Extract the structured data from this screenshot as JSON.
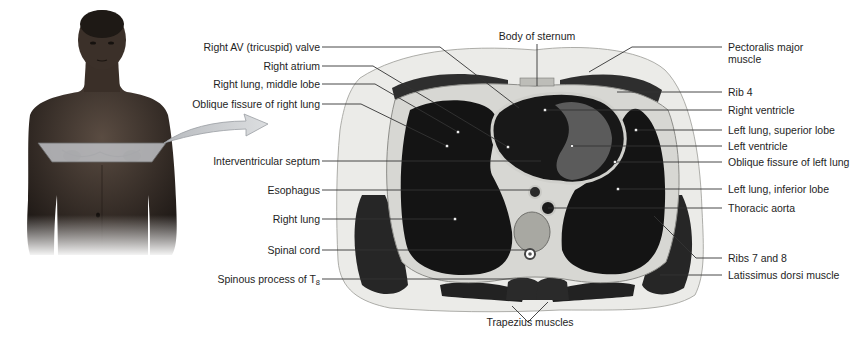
{
  "figure": {
    "body_photo": {
      "description": "Anterior view of male torso with transverse plane marked across chest",
      "plane_color": "#b9bcc0",
      "arrow_color": "#c9ccd0"
    },
    "labels_left": [
      {
        "id": "tricuspid",
        "text": "Right AV (tricuspid) valve"
      },
      {
        "id": "right-atrium",
        "text": "Right atrium"
      },
      {
        "id": "rlung-middle",
        "text": "Right lung, middle lobe"
      },
      {
        "id": "oblique-right",
        "text": "Oblique fissure of right lung"
      },
      {
        "id": "septum",
        "text": "Interventricular septum"
      },
      {
        "id": "esophagus",
        "text": "Esophagus"
      },
      {
        "id": "right-lung",
        "text": "Right lung"
      },
      {
        "id": "spinal-cord",
        "text": "Spinal cord"
      },
      {
        "id": "spinous",
        "text": "Spinous process of T",
        "sub": "8"
      }
    ],
    "labels_right": [
      {
        "id": "pectoralis",
        "text": "Pectoralis major",
        "text2": "muscle"
      },
      {
        "id": "rib4",
        "text": "Rib 4"
      },
      {
        "id": "right-ventricle",
        "text": "Right ventricle"
      },
      {
        "id": "llung-superior",
        "text": "Left lung, superior lobe"
      },
      {
        "id": "left-ventricle",
        "text": "Left ventricle"
      },
      {
        "id": "oblique-left",
        "text": "Oblique fissure of left lung"
      },
      {
        "id": "llung-inferior",
        "text": "Left lung, inferior lobe"
      },
      {
        "id": "aorta",
        "text": "Thoracic aorta"
      },
      {
        "id": "ribs78",
        "text": "Ribs 7 and 8"
      },
      {
        "id": "latissimus",
        "text": "Latissimus dorsi muscle"
      }
    ],
    "labels_center": {
      "sternum": "Body of sternum",
      "trapezius": "Trapezius muscles"
    },
    "colors": {
      "leader_line": "#333333",
      "lung": "#141414",
      "muscle": "#2e2e2e",
      "fat": "#e9e9e6",
      "bone": "#bdbdb8",
      "heart_wall": "#5a5a5a",
      "skin": "#3a3028"
    }
  }
}
